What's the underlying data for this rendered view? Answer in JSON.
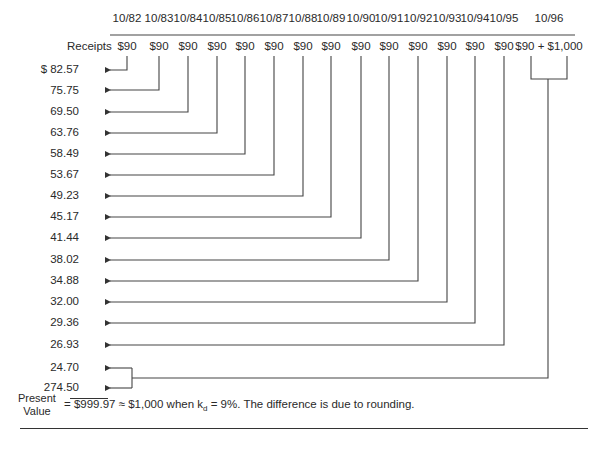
{
  "diagram": {
    "row_label": "Receipts",
    "columns": [
      {
        "date": "10/82",
        "receipt": "$90",
        "x": 127
      },
      {
        "date": "10/83",
        "receipt": "$90",
        "x": 159
      },
      {
        "date": "10/84",
        "receipt": "$90",
        "x": 188
      },
      {
        "date": "10/85",
        "receipt": "$90",
        "x": 217
      },
      {
        "date": "10/86",
        "receipt": "$90",
        "x": 245
      },
      {
        "date": "10/87",
        "receipt": "$90",
        "x": 274
      },
      {
        "date": "10/88",
        "receipt": "$90",
        "x": 303
      },
      {
        "date": "10/89",
        "receipt": "$90",
        "x": 331
      },
      {
        "date": "10/90",
        "receipt": "$90",
        "x": 361
      },
      {
        "date": "10/91",
        "receipt": "$90",
        "x": 389
      },
      {
        "date": "10/92",
        "receipt": "$90",
        "x": 418
      },
      {
        "date": "10/93",
        "receipt": "$90",
        "x": 447
      },
      {
        "date": "10/94",
        "receipt": "$90",
        "x": 475
      },
      {
        "date": "10/95",
        "receipt": "$90",
        "x": 504
      },
      {
        "date": "10/96",
        "receipt": "$90 + $1,000",
        "x": 549
      }
    ],
    "present_values": [
      {
        "label": "$ 82.57",
        "value": 82.57
      },
      {
        "label": "75.75",
        "value": 75.75
      },
      {
        "label": "69.50",
        "value": 69.5
      },
      {
        "label": "63.76",
        "value": 63.76
      },
      {
        "label": "58.49",
        "value": 58.49
      },
      {
        "label": "53.67",
        "value": 53.67
      },
      {
        "label": "49.23",
        "value": 49.23
      },
      {
        "label": "45.17",
        "value": 45.17
      },
      {
        "label": "41.44",
        "value": 41.44
      },
      {
        "label": "38.02",
        "value": 38.02
      },
      {
        "label": "34.88",
        "value": 34.88
      },
      {
        "label": "32.00",
        "value": 32.0
      },
      {
        "label": "29.36",
        "value": 29.36
      },
      {
        "label": "26.93",
        "value": 26.93
      },
      {
        "label": "24.70",
        "value": 24.7
      },
      {
        "label": "274.50",
        "value": 274.5
      }
    ],
    "summary": {
      "label_line1": "Present",
      "label_line2": "Value",
      "equals": "=",
      "total": "$999.97",
      "approx_text": "≈ $1,000 when k",
      "subscript": "d",
      "rate_text": " = 9%. The difference is due to rounding."
    }
  }
}
